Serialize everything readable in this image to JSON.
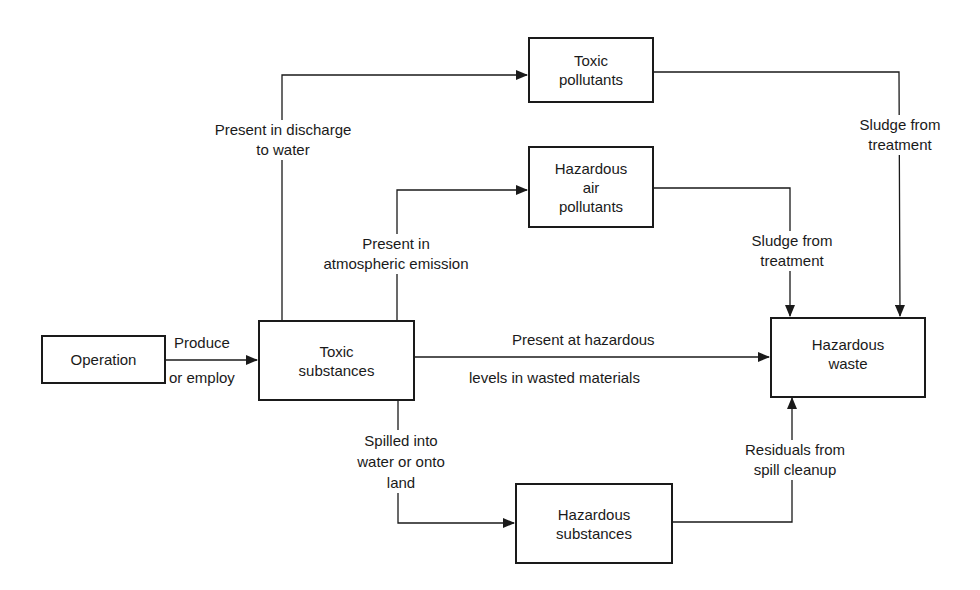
{
  "nodes": {
    "operation": "Operation",
    "toxic_substances": "Toxic\nsubstances",
    "toxic_pollutants": "Toxic\npollutants",
    "hazardous_air_pollutants": "Hazardous\nair\npollutants",
    "hazardous_waste": "Hazardous\nwaste",
    "hazardous_substances": "Hazardous\nsubstances"
  },
  "edges": {
    "produce_top": "Produce",
    "produce_bottom": "or employ",
    "discharge_water": "Present in discharge\nto water",
    "atmospheric": "Present in\natmospheric emission",
    "hazardous_levels_top": "Present at hazardous",
    "hazardous_levels_bottom": "levels in wasted materials",
    "spilled": "Spilled into\nwater or onto\nland",
    "sludge_toxic": "Sludge from\ntreatment",
    "sludge_air": "Sludge from\ntreatment",
    "residuals": "Residuals from\nspill cleanup"
  }
}
